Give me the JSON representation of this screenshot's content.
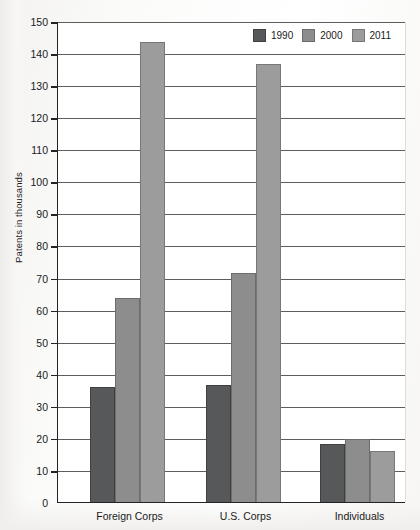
{
  "chart_data": {
    "type": "bar",
    "title": "",
    "xlabel": "",
    "ylabel": "Patents in thousands",
    "ylim": [
      0,
      150
    ],
    "ytick_step": 10,
    "yticks": [
      150,
      140,
      130,
      120,
      110,
      100,
      90,
      80,
      70,
      60,
      50,
      40,
      30,
      20,
      10,
      0
    ],
    "grid": true,
    "legend_position": "top-right",
    "categories": [
      "Foreign Corps",
      "U.S. Corps",
      "Individuals"
    ],
    "series": [
      {
        "name": "1990",
        "color": "#57585a",
        "values": [
          36.0,
          36.5,
          18.0
        ]
      },
      {
        "name": "2000",
        "color": "#8d8d8d",
        "values": [
          63.5,
          71.5,
          19.8
        ]
      },
      {
        "name": "2011",
        "color": "#9c9c9c",
        "values": [
          143.5,
          136.5,
          15.8
        ]
      }
    ]
  },
  "legend": {
    "items": [
      {
        "label": "1990"
      },
      {
        "label": "2000"
      },
      {
        "label": "2011"
      }
    ]
  },
  "colors": {
    "series_1990": "#57585a",
    "series_2000": "#8d8d8d",
    "series_2011": "#9c9c9c",
    "axis": "#232323",
    "gridline": "#5d5d5d",
    "plot_background": "#ffffff"
  }
}
